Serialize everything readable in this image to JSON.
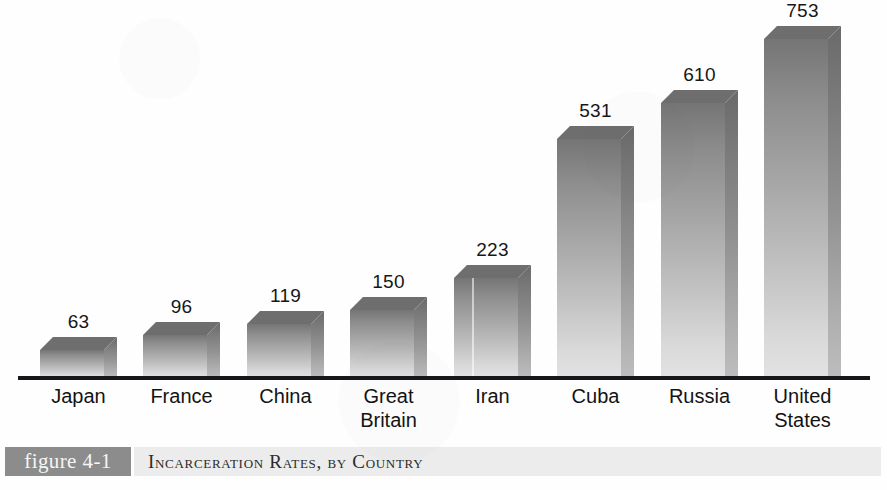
{
  "chart_data": {
    "type": "bar",
    "title": "Incarceration Rates, by Country",
    "xlabel": "",
    "ylabel": "",
    "ylim": [
      0,
      753
    ],
    "grid": false,
    "legend": "none",
    "axis": "baseline only, no y-axis ticks",
    "categories": [
      "Japan",
      "France",
      "China",
      "Great Britain",
      "Iran",
      "Cuba",
      "Russia",
      "United States"
    ],
    "values": [
      63,
      96,
      119,
      150,
      223,
      531,
      610,
      753
    ],
    "value_labels": [
      "63",
      "96",
      "119",
      "150",
      "223",
      "531",
      "610",
      "753"
    ],
    "bars": [
      {
        "category": "Japan",
        "label_line1": "Japan",
        "label_line2": "",
        "value": 63,
        "value_label": "63",
        "left": 40,
        "width": 64
      },
      {
        "category": "France",
        "label_line1": "France",
        "label_line2": "",
        "value": 96,
        "value_label": "96",
        "left": 143,
        "width": 64
      },
      {
        "category": "China",
        "label_line1": "China",
        "label_line2": "",
        "value": 119,
        "value_label": "119",
        "left": 247,
        "width": 64
      },
      {
        "category": "Great Britain",
        "label_line1": "Great",
        "label_line2": "Britain",
        "value": 150,
        "value_label": "150",
        "left": 350,
        "width": 64
      },
      {
        "category": "Iran",
        "label_line1": "Iran",
        "label_line2": "",
        "value": 223,
        "value_label": "223",
        "left": 454,
        "width": 64
      },
      {
        "category": "Cuba",
        "label_line1": "Cuba",
        "label_line2": "",
        "value": 531,
        "value_label": "531",
        "left": 557,
        "width": 64
      },
      {
        "category": "Russia",
        "label_line1": "Russia",
        "label_line2": "",
        "value": 610,
        "value_label": "610",
        "left": 661,
        "width": 64
      },
      {
        "category": "United States",
        "label_line1": "United",
        "label_line2": "States",
        "value": 753,
        "value_label": "753",
        "left": 764,
        "width": 64
      }
    ]
  },
  "caption": {
    "tag": "figure 4-1",
    "text": "Incarceration Rates, by Country"
  },
  "colors": {
    "bar_front_top": "#757575",
    "bar_front_bottom": "#e2e2e2",
    "bar_side": "#7d7d7d",
    "bar_top_face": "#6e6e6e",
    "baseline": "#15171a",
    "caption_tag_bg": "#8c8c8c",
    "caption_band_bg": "#ececec",
    "text": "#131313",
    "page_bg": "#fefefe"
  }
}
